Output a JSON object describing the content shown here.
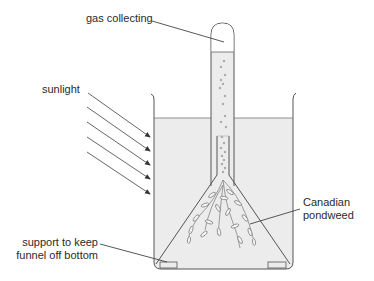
{
  "diagram": {
    "colors": {
      "line": "#555555",
      "water": "#ececec",
      "gas": "#ffffff",
      "label_text": "#2a2a2a",
      "weed": "#777777"
    },
    "labels": {
      "gas_collecting": "gas collecting",
      "sunlight": "sunlight",
      "canadian": "Canadian",
      "pondweed": "pondweed",
      "support_line1": "support to keep",
      "support_line2": "funnel off bottom"
    },
    "components": [
      "beaker",
      "water",
      "test-tube",
      "gas",
      "funnel",
      "pondweed",
      "supports",
      "sunlight-arrows",
      "bubbles"
    ],
    "sunlight_arrow_count": 5
  }
}
